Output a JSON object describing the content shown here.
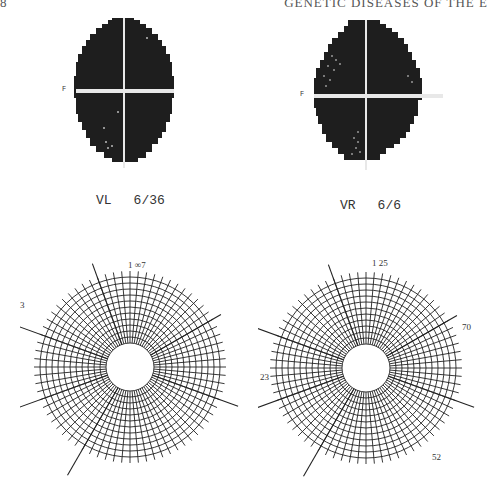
{
  "header": {
    "page_number": "8",
    "running_title": "GENETIC DISEASES OF THE E"
  },
  "figures": {
    "left_field": {
      "eye": "VL",
      "acuity": "6/36",
      "marker": "F",
      "fill_color": "#1e1e1e"
    },
    "right_field": {
      "eye": "VR",
      "acuity": "6/6",
      "marker": "F",
      "fill_color": "#1e1e1e"
    },
    "left_polar": {
      "labels": {
        "top": "1 ∞7",
        "left": "3",
        "lower_right": "52"
      }
    },
    "right_polar": {
      "labels": {
        "top": "1 25",
        "right": "70",
        "left": "23",
        "lower_right": "52",
        "inner_top": "F",
        "inner_left": "H",
        "inner_right": "F",
        "inner_bl": "B",
        "inner_br": "B"
      }
    }
  }
}
